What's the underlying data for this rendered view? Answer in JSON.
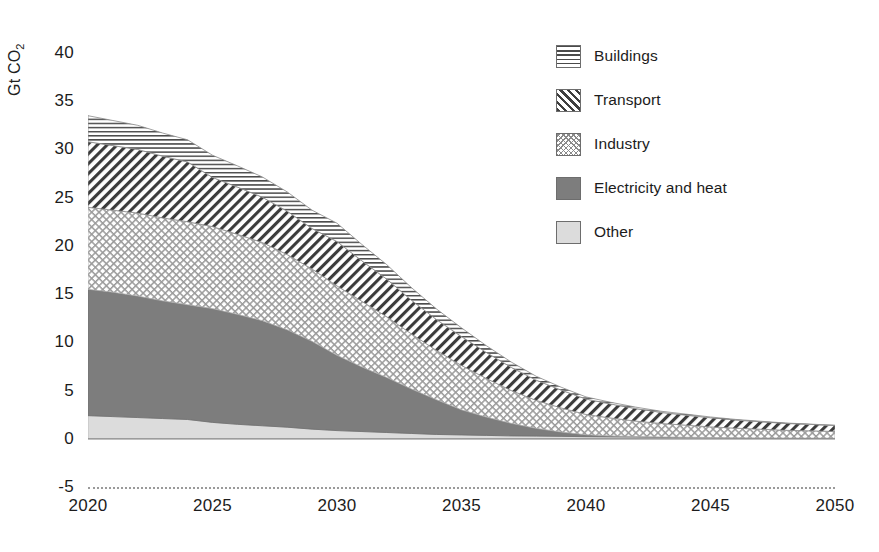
{
  "chart_data": {
    "type": "area",
    "stacked": true,
    "title": "",
    "xlabel": "",
    "ylabel": "Gt CO2",
    "ylabel_display": "Gt CO",
    "ylabel_subscript": "2",
    "x": [
      2020,
      2021,
      2022,
      2023,
      2024,
      2025,
      2026,
      2027,
      2028,
      2029,
      2030,
      2031,
      2032,
      2033,
      2034,
      2035,
      2036,
      2037,
      2038,
      2039,
      2040,
      2041,
      2042,
      2043,
      2044,
      2045,
      2046,
      2047,
      2048,
      2049,
      2050
    ],
    "xlim": [
      2020,
      2050
    ],
    "ylim": [
      -5,
      40
    ],
    "ytick_labels": [
      "40",
      "35",
      "30",
      "25",
      "20",
      "15",
      "10",
      "5",
      "0",
      "-5"
    ],
    "ytick_values": [
      40,
      35,
      30,
      25,
      20,
      15,
      10,
      5,
      0,
      -5
    ],
    "xtick_labels": [
      "2020",
      "2025",
      "2030",
      "2035",
      "2040",
      "2045",
      "2050"
    ],
    "xtick_values": [
      2020,
      2025,
      2030,
      2035,
      2040,
      2045,
      2050
    ],
    "grid": false,
    "legend_position": "top-right",
    "stack_order_bottom_to_top": [
      "Other",
      "Electricity and heat",
      "Industry",
      "Transport",
      "Buildings"
    ],
    "series": [
      {
        "name": "Other",
        "pattern": "solid-light-gray",
        "color": "#dcdcdc",
        "values": [
          2.4,
          2.3,
          2.2,
          2.1,
          2.0,
          1.7,
          1.5,
          1.35,
          1.2,
          1.0,
          0.85,
          0.75,
          0.65,
          0.55,
          0.45,
          0.4,
          0.35,
          0.3,
          0.28,
          0.25,
          0.22,
          0.2,
          0.18,
          0.16,
          0.14,
          0.12,
          0.1,
          0.09,
          0.08,
          0.07,
          0.06
        ]
      },
      {
        "name": "Electricity and heat",
        "pattern": "solid-dark-gray",
        "color": "#7d7d7d",
        "values": [
          13.1,
          12.9,
          12.6,
          12.2,
          11.9,
          11.8,
          11.4,
          10.9,
          10.1,
          9.1,
          7.8,
          6.7,
          5.7,
          4.6,
          3.6,
          2.6,
          1.9,
          1.3,
          0.8,
          0.45,
          0.2,
          0.1,
          0.05,
          0.03,
          0.02,
          0.01,
          0.0,
          0.0,
          0.0,
          0.0,
          0.0
        ]
      },
      {
        "name": "Industry",
        "pattern": "cross-hatch",
        "color": "#ffffff",
        "values": [
          8.5,
          8.5,
          8.6,
          8.6,
          8.6,
          8.5,
          8.3,
          8.1,
          7.8,
          7.5,
          7.2,
          6.8,
          6.3,
          5.7,
          5.1,
          4.6,
          4.0,
          3.4,
          2.9,
          2.5,
          2.1,
          1.85,
          1.6,
          1.4,
          1.25,
          1.1,
          1.0,
          0.9,
          0.8,
          0.75,
          0.7
        ]
      },
      {
        "name": "Transport",
        "pattern": "diagonal-hatch",
        "color": "#ffffff",
        "values": [
          6.8,
          6.7,
          6.6,
          6.4,
          6.2,
          5.1,
          4.9,
          4.7,
          4.5,
          4.2,
          4.6,
          4.2,
          3.9,
          3.5,
          3.2,
          3.0,
          2.7,
          2.4,
          2.1,
          1.85,
          1.6,
          1.45,
          1.3,
          1.15,
          1.05,
          0.95,
          0.85,
          0.78,
          0.72,
          0.67,
          0.62
        ]
      },
      {
        "name": "Buildings",
        "pattern": "horizontal-lines",
        "color": "#ffffff",
        "values": [
          2.7,
          2.6,
          2.5,
          2.4,
          2.3,
          2.3,
          2.2,
          2.1,
          2.0,
          1.9,
          1.9,
          1.7,
          1.5,
          1.3,
          1.1,
          0.9,
          0.7,
          0.55,
          0.4,
          0.3,
          0.22,
          0.18,
          0.15,
          0.12,
          0.1,
          0.08,
          0.06,
          0.05,
          0.04,
          0.03,
          0.02
        ]
      }
    ],
    "totals": [
      33.5,
      33.0,
      32.5,
      31.7,
      31.0,
      29.4,
      28.3,
      27.15,
      25.6,
      23.7,
      22.35,
      20.15,
      18.05,
      15.65,
      13.45,
      11.5,
      9.65,
      7.95,
      6.48,
      5.35,
      4.34,
      3.78,
      3.28,
      2.86,
      2.56,
      2.26,
      2.01,
      1.82,
      1.64,
      1.52,
      1.4
    ]
  },
  "legend": {
    "items": [
      {
        "label": "Buildings",
        "swatch": "sw-buildings"
      },
      {
        "label": "Transport",
        "swatch": "sw-transport"
      },
      {
        "label": "Industry",
        "swatch": "sw-industry"
      },
      {
        "label": "Electricity and heat",
        "swatch": "sw-electricity"
      },
      {
        "label": "Other",
        "swatch": "sw-other"
      }
    ]
  },
  "axes": {
    "y_label_main": "Gt CO",
    "y_label_sub": "2",
    "y_ticks": [
      "40",
      "35",
      "30",
      "25",
      "20",
      "15",
      "10",
      "5",
      "0",
      "-5"
    ],
    "x_ticks": [
      "2020",
      "2025",
      "2030",
      "2035",
      "2040",
      "2045",
      "2050"
    ]
  },
  "colors": {
    "electricity": "#7d7d7d",
    "other": "#dcdcdc",
    "hatch": "#3f3f3f",
    "axis_text": "#1c1c1c",
    "baseline": "#9a9a9a"
  }
}
